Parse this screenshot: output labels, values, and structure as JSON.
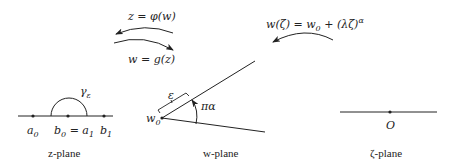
{
  "diagram": {
    "maps": {
      "z_from_w": "z = φ(w)",
      "w_from_z": "w = g(z)",
      "w_from_zeta": {
        "lhs": "w(ζ) = w",
        "w0_sub": "0",
        "rhs": " + (λζ)",
        "exponent": "α"
      }
    },
    "z_plane": {
      "label": "z-plane",
      "points": [
        {
          "name": "a",
          "sub": "0"
        },
        {
          "name": "b",
          "sub": "0",
          "eq": " = a",
          "eq_sub": "1"
        },
        {
          "name": "b",
          "sub": "1"
        }
      ],
      "arc_label": {
        "name": "γ",
        "sub": "ε"
      }
    },
    "w_plane": {
      "label": "w-plane",
      "vertex": {
        "name": "w",
        "sub": "0"
      },
      "bracket_label": "ε",
      "angle_label": "πα"
    },
    "zeta_plane": {
      "label": "ζ-plane",
      "origin": "O"
    },
    "colors": {
      "stroke": "#222222",
      "background": "#ffffff"
    }
  }
}
